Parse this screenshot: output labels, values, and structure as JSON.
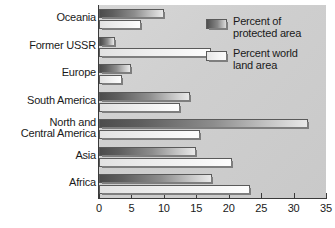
{
  "chart_data": {
    "type": "bar",
    "orientation": "horizontal",
    "title": "",
    "xlabel": "",
    "ylabel": "",
    "xlim": [
      0,
      35
    ],
    "grid": false,
    "tick_labels": [
      "0",
      "5",
      "10",
      "15",
      "20",
      "25",
      "30",
      "35"
    ],
    "ticks": [
      0,
      5,
      10,
      15,
      20,
      25,
      30,
      35
    ],
    "categories": [
      "Oceania",
      "Former USSR",
      "Europe",
      "South America",
      "North and\nCentral America",
      "Asia",
      "Africa"
    ],
    "legend_position": "top-right",
    "series": [
      {
        "name": "Percent of\nprotected area",
        "color": "#5e5e5e",
        "values": [
          10.0,
          2.4,
          5.0,
          14.0,
          32.2,
          15.0,
          17.4
        ]
      },
      {
        "name": "Percent world\nland area",
        "color": "#f2f2f2",
        "values": [
          6.5,
          17.3,
          3.6,
          12.5,
          15.5,
          20.5,
          23.3
        ]
      }
    ]
  },
  "legend": {
    "items": [
      {
        "label": "Percent of\nprotected area",
        "swatch": "dark"
      },
      {
        "label": "Percent world\nland area",
        "swatch": "light"
      }
    ]
  }
}
